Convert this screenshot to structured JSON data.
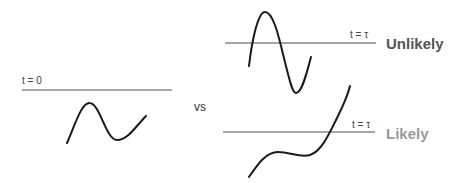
{
  "left_panel": {
    "time_label": "t = 0"
  },
  "separator": {
    "label": "vs"
  },
  "top_right_panel": {
    "time_label": "t = τ",
    "verdict": "Unlikely",
    "verdict_color": "#555555"
  },
  "bottom_right_panel": {
    "time_label": "t = τ",
    "verdict": "Likely",
    "verdict_color": "#9a9a9a"
  },
  "colors": {
    "baseline": "#a6a6a6",
    "curve": "#1a1a1a"
  }
}
